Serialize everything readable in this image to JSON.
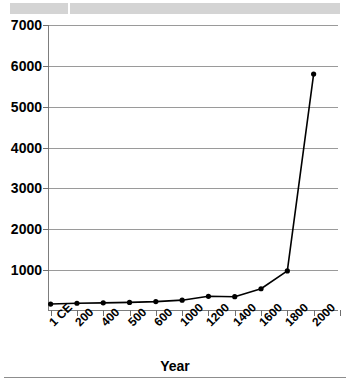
{
  "header": {
    "cells": [
      "",
      ""
    ]
  },
  "chart_data": {
    "type": "line",
    "title": "",
    "subtitle": "",
    "xlabel": "Year",
    "ylabel": "",
    "grid": true,
    "legend": "none",
    "xlim_labels": [
      "1 CE",
      "2000"
    ],
    "ylim": [
      0,
      7000
    ],
    "ytick_labels": [
      "7000",
      "6000",
      "5000",
      "4000",
      "3000",
      "2000",
      "1000"
    ],
    "ytick_values": [
      7000,
      6000,
      5000,
      4000,
      3000,
      2000,
      1000
    ],
    "xtick_labels": [
      "1 CE",
      "200",
      "400",
      "500",
      "600",
      "1000",
      "1200",
      "1400",
      "1600",
      "1800",
      "2000"
    ],
    "categories": [
      "1 CE",
      "200",
      "400",
      "500",
      "600",
      "1000",
      "1200",
      "1400",
      "1600",
      "1800",
      "2000"
    ],
    "values": [
      170,
      190,
      200,
      210,
      230,
      265,
      360,
      350,
      545,
      980,
      5800
    ],
    "marker": "circle",
    "line_color": "#000000",
    "marker_color": "#000000"
  },
  "axis": {
    "x_title": "Year"
  }
}
